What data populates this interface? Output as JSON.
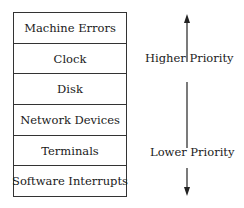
{
  "diagram": {
    "levels": [
      {
        "label": "Machine Errors"
      },
      {
        "label": "Clock"
      },
      {
        "label": "Disk"
      },
      {
        "label": "Network Devices"
      },
      {
        "label": "Terminals"
      },
      {
        "label": "Software Interrupts"
      }
    ],
    "axis": {
      "top_label": "Higher Priority",
      "bottom_label": "Lower Priority",
      "icon": "double-headed-vertical-arrow"
    }
  }
}
